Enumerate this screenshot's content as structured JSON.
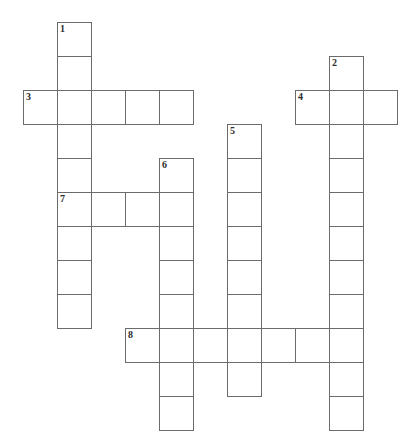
{
  "puzzle": {
    "title": "Crossword Puzzle Grid",
    "cell_size": 34,
    "origin_x": 23,
    "origin_y": 22,
    "background_color": "#ffffff",
    "cell_fill_color": "#ffffff",
    "cell_border_color": "#6b6b6b",
    "number_color": "#2b2b2b",
    "total_entries": 8,
    "entry_count_across": 4,
    "entry_count_down": 4,
    "entries": [
      {
        "number": "1",
        "direction": "down",
        "length": 9,
        "start_col": 1,
        "start_row": 0,
        "label": "1-Down"
      },
      {
        "number": "2",
        "direction": "down",
        "length": 11,
        "start_col": 9,
        "start_row": 1,
        "label": "2-Down"
      },
      {
        "number": "3",
        "direction": "across",
        "length": 5,
        "start_col": 0,
        "start_row": 2,
        "label": "3-Across"
      },
      {
        "number": "4",
        "direction": "across",
        "length": 3,
        "start_col": 8,
        "start_row": 2,
        "label": "4-Across"
      },
      {
        "number": "5",
        "direction": "down",
        "length": 8,
        "start_col": 6,
        "start_row": 3,
        "label": "5-Down"
      },
      {
        "number": "6",
        "direction": "down",
        "length": 8,
        "start_col": 4,
        "start_row": 4,
        "label": "6-Down"
      },
      {
        "number": "7",
        "direction": "across",
        "length": 4,
        "start_col": 1,
        "start_row": 5,
        "label": "7-Across"
      },
      {
        "number": "8",
        "direction": "across",
        "length": 7,
        "start_col": 3,
        "start_row": 9,
        "label": "8-Across"
      }
    ],
    "cells": [
      {
        "col": 1,
        "row": 0,
        "number": "1"
      },
      {
        "col": 1,
        "row": 1,
        "number": ""
      },
      {
        "col": 9,
        "row": 1,
        "number": "2"
      },
      {
        "col": 0,
        "row": 2,
        "number": "3"
      },
      {
        "col": 1,
        "row": 2,
        "number": ""
      },
      {
        "col": 2,
        "row": 2,
        "number": ""
      },
      {
        "col": 3,
        "row": 2,
        "number": ""
      },
      {
        "col": 4,
        "row": 2,
        "number": ""
      },
      {
        "col": 8,
        "row": 2,
        "number": "4"
      },
      {
        "col": 9,
        "row": 2,
        "number": ""
      },
      {
        "col": 10,
        "row": 2,
        "number": ""
      },
      {
        "col": 1,
        "row": 3,
        "number": ""
      },
      {
        "col": 6,
        "row": 3,
        "number": "5"
      },
      {
        "col": 9,
        "row": 3,
        "number": ""
      },
      {
        "col": 1,
        "row": 4,
        "number": ""
      },
      {
        "col": 4,
        "row": 4,
        "number": "6"
      },
      {
        "col": 6,
        "row": 4,
        "number": ""
      },
      {
        "col": 9,
        "row": 4,
        "number": ""
      },
      {
        "col": 1,
        "row": 5,
        "number": "7"
      },
      {
        "col": 2,
        "row": 5,
        "number": ""
      },
      {
        "col": 3,
        "row": 5,
        "number": ""
      },
      {
        "col": 4,
        "row": 5,
        "number": ""
      },
      {
        "col": 6,
        "row": 5,
        "number": ""
      },
      {
        "col": 9,
        "row": 5,
        "number": ""
      },
      {
        "col": 1,
        "row": 6,
        "number": ""
      },
      {
        "col": 4,
        "row": 6,
        "number": ""
      },
      {
        "col": 6,
        "row": 6,
        "number": ""
      },
      {
        "col": 9,
        "row": 6,
        "number": ""
      },
      {
        "col": 1,
        "row": 7,
        "number": ""
      },
      {
        "col": 4,
        "row": 7,
        "number": ""
      },
      {
        "col": 6,
        "row": 7,
        "number": ""
      },
      {
        "col": 9,
        "row": 7,
        "number": ""
      },
      {
        "col": 1,
        "row": 8,
        "number": ""
      },
      {
        "col": 4,
        "row": 8,
        "number": ""
      },
      {
        "col": 6,
        "row": 8,
        "number": ""
      },
      {
        "col": 9,
        "row": 8,
        "number": ""
      },
      {
        "col": 3,
        "row": 9,
        "number": "8"
      },
      {
        "col": 4,
        "row": 9,
        "number": ""
      },
      {
        "col": 5,
        "row": 9,
        "number": ""
      },
      {
        "col": 6,
        "row": 9,
        "number": ""
      },
      {
        "col": 7,
        "row": 9,
        "number": ""
      },
      {
        "col": 8,
        "row": 9,
        "number": ""
      },
      {
        "col": 9,
        "row": 9,
        "number": ""
      },
      {
        "col": 4,
        "row": 10,
        "number": ""
      },
      {
        "col": 6,
        "row": 10,
        "number": ""
      },
      {
        "col": 9,
        "row": 10,
        "number": ""
      },
      {
        "col": 4,
        "row": 11,
        "number": ""
      },
      {
        "col": 9,
        "row": 11,
        "number": ""
      }
    ]
  }
}
